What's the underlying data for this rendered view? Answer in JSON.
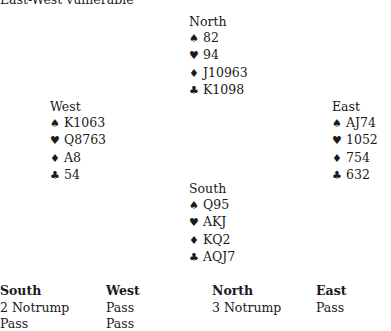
{
  "vulnerability": "East-West vulnerable",
  "hands": {
    "north": {
      "name": "North",
      "spades": "82",
      "hearts": "94",
      "diamonds": "J10963",
      "clubs": "K1098"
    },
    "west": {
      "name": "West",
      "spades": "K1063",
      "hearts": "Q8763",
      "diamonds": "A8",
      "clubs": "54"
    },
    "east": {
      "name": "East",
      "spades": "AJ74",
      "hearts": "1052",
      "diamonds": "754",
      "clubs": "632"
    },
    "south": {
      "name": "South",
      "spades": "Q95",
      "hearts": "AKJ",
      "diamonds": "KQ2",
      "clubs": "AQJ7"
    }
  },
  "suit_symbols": {
    "spades": "♠",
    "hearts": "♥",
    "diamonds": "♦",
    "clubs": "♣"
  },
  "auction": {
    "columns": [
      {
        "header": "South",
        "bids": [
          "2 Notrump",
          "Pass"
        ]
      },
      {
        "header": "West",
        "bids": [
          "Pass",
          "Pass"
        ]
      },
      {
        "header": "North",
        "bids": [
          "3 Notrump"
        ]
      },
      {
        "header": "East",
        "bids": [
          "Pass"
        ]
      }
    ]
  }
}
